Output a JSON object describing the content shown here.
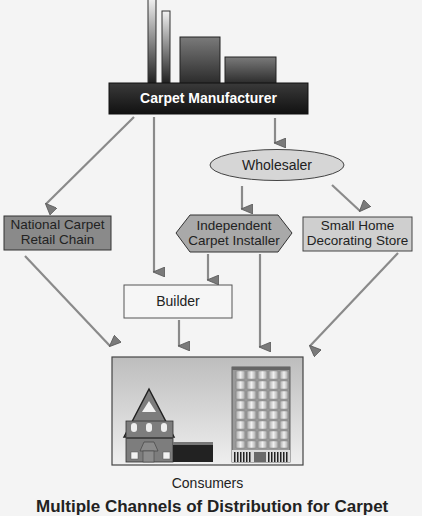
{
  "diagram": {
    "title": "Multiple Channels of Distribution for Carpet",
    "nodes": {
      "manufacturer": {
        "label": "Carpet Manufacturer",
        "fill": "#2a2a2a",
        "text_color": "#ffffff"
      },
      "wholesaler": {
        "label": "Wholesaler",
        "fill": "#d6d6d6"
      },
      "national_chain": {
        "label_line1": "National Carpet",
        "label_line2": "Retail Chain",
        "fill": "#8a8a8a"
      },
      "installer": {
        "label_line1": "Independent",
        "label_line2": "Carpet Installer",
        "fill": "#a9a9a9"
      },
      "small_store": {
        "label_line1": "Small Home",
        "label_line2": "Decorating Store",
        "fill": "#cfcfcf"
      },
      "builder": {
        "label": "Builder",
        "fill": "#f6f6f6"
      },
      "consumers": {
        "label": "Consumers",
        "fill": "#d0d0d0"
      }
    },
    "edges": [
      {
        "from": "Carpet Manufacturer",
        "to": "National Carpet Retail Chain"
      },
      {
        "from": "Carpet Manufacturer",
        "to": "Builder"
      },
      {
        "from": "Carpet Manufacturer",
        "to": "Wholesaler"
      },
      {
        "from": "Wholesaler",
        "to": "Independent Carpet Installer"
      },
      {
        "from": "Wholesaler",
        "to": "Small Home Decorating Store"
      },
      {
        "from": "Independent Carpet Installer",
        "to": "Builder"
      },
      {
        "from": "Independent Carpet Installer",
        "to": "Consumers"
      },
      {
        "from": "National Carpet Retail Chain",
        "to": "Consumers"
      },
      {
        "from": "Builder",
        "to": "Consumers"
      },
      {
        "from": "Small Home Decorating Store",
        "to": "Consumers"
      }
    ]
  }
}
